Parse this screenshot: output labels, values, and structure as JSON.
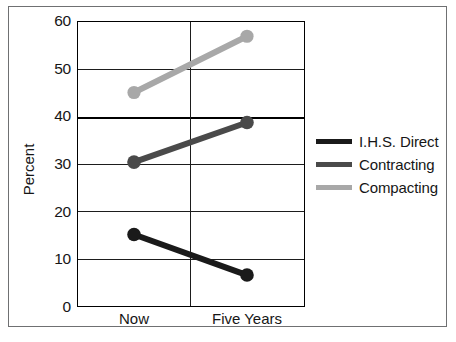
{
  "chart_data": {
    "type": "line",
    "title": "",
    "xlabel": "",
    "ylabel": "Percent",
    "categories": [
      "Now",
      "Five Years"
    ],
    "x_tick_labels": [
      "Now",
      "Five Years"
    ],
    "y_tick_labels": [
      "0",
      "10",
      "20",
      "30",
      "40",
      "50",
      "60"
    ],
    "y_ticks": [
      0,
      10,
      20,
      30,
      40,
      50,
      60
    ],
    "ylim": [
      0,
      60
    ],
    "grid": true,
    "grid_axis": "y",
    "emphasized_gridline": 40,
    "legend_position": "right",
    "series": [
      {
        "name": "I.H.S. Direct",
        "color": "#1a1a1a",
        "values": [
          15.2,
          6.7
        ]
      },
      {
        "name": "Contracting",
        "color": "#4a4a4a",
        "values": [
          30.4,
          38.7
        ]
      },
      {
        "name": "Compacting",
        "color": "#a8a8a8",
        "values": [
          45.0,
          56.8
        ]
      }
    ]
  },
  "legend": {
    "entries": [
      {
        "label": "I.H.S. Direct",
        "color": "#1a1a1a"
      },
      {
        "label": "Contracting",
        "color": "#4a4a4a"
      },
      {
        "label": "Compacting",
        "color": "#a8a8a8"
      }
    ]
  },
  "caption": {
    "text": ""
  },
  "colors": {
    "frame": "#6f7072",
    "axis": "#000000",
    "grid": "#1d1d1d",
    "text": "#161616"
  }
}
